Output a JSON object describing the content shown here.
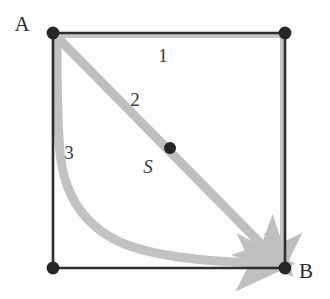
{
  "figure": {
    "background_color": "#fdfdfd",
    "edge_color": "#2e2e2e",
    "path_color": "#bfbfbf",
    "vertex_color": "#262626",
    "vertices": [
      {
        "id": "A",
        "label": "A",
        "x": 53,
        "y": 33,
        "label_x": 22,
        "label_y": 31
      },
      {
        "id": "TR",
        "label": "",
        "x": 285,
        "y": 33,
        "label_x": 0,
        "label_y": 0
      },
      {
        "id": "BL",
        "label": "",
        "x": 53,
        "y": 268,
        "label_x": 0,
        "label_y": 0
      },
      {
        "id": "B",
        "label": "B",
        "x": 285,
        "y": 268,
        "label_x": 306,
        "label_y": 278
      }
    ],
    "midpoint": {
      "id": "S",
      "label": "S",
      "x": 170,
      "y": 148,
      "label_x": 148,
      "label_y": 173
    },
    "paths": [
      {
        "id": "path-1",
        "label": "1",
        "label_x": 163,
        "label_y": 62,
        "shape": "top-then-right-edge"
      },
      {
        "id": "path-2",
        "label": "2",
        "label_x": 135,
        "label_y": 106,
        "shape": "straight-diagonal"
      },
      {
        "id": "path-3",
        "label": "3",
        "label_x": 69,
        "label_y": 159,
        "shape": "hyperbolic-curve"
      }
    ],
    "square": {
      "left": 53,
      "top": 33,
      "right": 285,
      "bottom": 268
    }
  }
}
